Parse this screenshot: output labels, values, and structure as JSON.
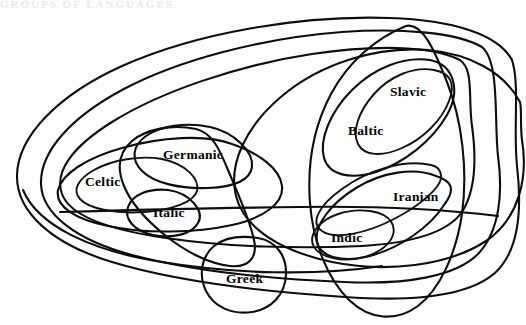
{
  "figure": {
    "kind": "euler-diagram",
    "background_color": "#fdfdfd",
    "stroke_color": "#0d0d0d",
    "cropped_header_text": "GROUPS  OF  LANGUAGES"
  },
  "labels": [
    {
      "id": "germanic",
      "text": "Germanic",
      "x": 163,
      "y": 148
    },
    {
      "id": "celtic",
      "text": "Celtic",
      "x": 85,
      "y": 175
    },
    {
      "id": "italic",
      "text": "Italic",
      "x": 153,
      "y": 206
    },
    {
      "id": "greek",
      "text": "Greek",
      "x": 226,
      "y": 272
    },
    {
      "id": "slavic",
      "text": "Slavic",
      "x": 390,
      "y": 85
    },
    {
      "id": "baltic",
      "text": "Baltic",
      "x": 348,
      "y": 124
    },
    {
      "id": "iranian",
      "text": "Iranian",
      "x": 393,
      "y": 190
    },
    {
      "id": "indic",
      "text": "Indic",
      "x": 331,
      "y": 231
    }
  ],
  "regions": [
    {
      "id": "indo-european-outer",
      "name": "Indo-European (outermost loop)"
    },
    {
      "id": "centum-satem-mid",
      "name": "intermediate isogloss loop"
    },
    {
      "id": "western-group",
      "name": "Western group loop"
    },
    {
      "id": "celtic-italic-group",
      "name": "Celtic + Italic loop"
    },
    {
      "id": "italo-germanic",
      "name": "Italic + Germanic loop"
    },
    {
      "id": "balto-slavic",
      "name": "Balto-Slavic loop"
    },
    {
      "id": "indo-iranian",
      "name": "Indo-Iranian loop"
    },
    {
      "id": "satem-group",
      "name": "Satem group loop"
    },
    {
      "id": "greek-loop",
      "name": "Greek loop"
    },
    {
      "id": "eastern-sweep",
      "name": "Eastern sweep loop"
    }
  ]
}
